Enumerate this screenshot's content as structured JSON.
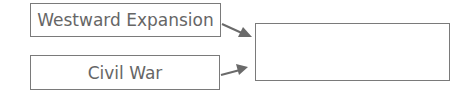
{
  "diagram": {
    "type": "cause-effect graphic organizer",
    "inputs": [
      {
        "label": "Westward Expansion"
      },
      {
        "label": "Civil War"
      }
    ],
    "output": {
      "label": ""
    },
    "colors": {
      "border": "#7a7a7a",
      "text": "#666666",
      "arrow": "#6a6a6a"
    }
  }
}
